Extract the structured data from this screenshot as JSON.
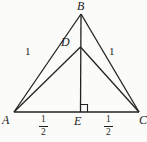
{
  "figure": {
    "background_color": "#fbfbf9",
    "line_color": "#222222",
    "points": {
      "A": "A",
      "B": "B",
      "C": "C",
      "D": "D",
      "E": "E"
    },
    "side_labels": {
      "ab": "1",
      "bc": "1"
    },
    "base_labels": {
      "ae": {
        "numerator": "1",
        "denominator": "2"
      },
      "ec": {
        "numerator": "1",
        "denominator": "2"
      }
    }
  }
}
